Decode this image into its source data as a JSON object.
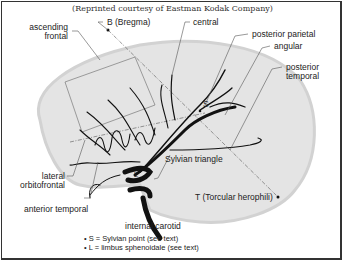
{
  "caption": "(Reprinted courtesy of Eastman Kodak Company)",
  "labels": {
    "ascending_frontal_1": "ascending",
    "ascending_frontal_2": "frontal",
    "bregma": "B (Bregma)",
    "central": "central",
    "posterior_parietal": "posterior parietal",
    "angular": "angular",
    "posterior_temporal_1": "posterior",
    "posterior_temporal_2": "temporal",
    "sylvian_point_marker": "S",
    "limbus_marker": "L",
    "sylvian_triangle": "Sylvian triangle",
    "lateral_orbitofrontal_1": "lateral",
    "lateral_orbitofrontal_2": "orbitofrontal",
    "anterior_temporal": "anterior temporal",
    "torcular": "T (Torcular herophili)",
    "internal_carotid": "internal carotid"
  },
  "notes": [
    "S = Sylvian point (see text)",
    "L = limbus sphenoidale (see text)"
  ],
  "colors": {
    "brain_fill": "#e4e4e4",
    "brain_edge": "#cfcfcf",
    "vessel": "#111111",
    "leader_line": "#555555",
    "frame": "#333333"
  }
}
